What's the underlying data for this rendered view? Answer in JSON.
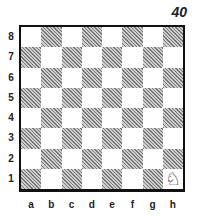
{
  "diagram_number": "40",
  "ranks": [
    "8",
    "7",
    "6",
    "5",
    "4",
    "3",
    "2",
    "1"
  ],
  "files": [
    "a",
    "b",
    "c",
    "d",
    "e",
    "f",
    "g",
    "h"
  ],
  "pieces": [
    {
      "square": "h1",
      "piece": "white-knight",
      "glyph": "♘"
    }
  ],
  "colors": {
    "dark_square": "#9a9a9a",
    "light_square": "#ffffff",
    "border": "#111111"
  }
}
